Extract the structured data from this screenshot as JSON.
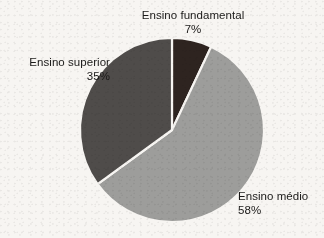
{
  "chart_data": {
    "type": "pie",
    "title": "",
    "subtitle": "",
    "xlabel": "",
    "ylabel": "",
    "legend_position": "none",
    "grid": false,
    "labels_on_slices": false,
    "label_style": "callout text outside slices",
    "start_angle_deg": 0,
    "direction": "clockwise",
    "units": "percent",
    "categories": [
      "Ensino fundamental",
      "Ensino médio",
      "Ensino superior"
    ],
    "values": [
      7,
      58,
      35
    ],
    "total": 100,
    "slices": [
      {
        "name": "Ensino fundamental",
        "value": 7,
        "value_label": "7%",
        "color": "#2e2420",
        "start_angle_deg": 0,
        "sweep_angle_deg": 25.2,
        "label_position": "top"
      },
      {
        "name": "Ensino médio",
        "value": 58,
        "value_label": "58%",
        "color": "#9d9d9b",
        "start_angle_deg": 25.2,
        "sweep_angle_deg": 208.8,
        "label_position": "bottom-right"
      },
      {
        "name": "Ensino superior",
        "value": 35,
        "value_label": "35%",
        "color": "#4f4c4a",
        "start_angle_deg": 234.0,
        "sweep_angle_deg": 126.0,
        "label_position": "left"
      }
    ]
  },
  "figure": {
    "background_color": "#f7f5f2",
    "slice_separator_color": "#f7f5f2",
    "text_color": "#1b1a19",
    "center_x": 172,
    "center_y": 130,
    "radius": 92
  },
  "labels": {
    "fundamental": {
      "name": "Ensino fundamental",
      "percent": "7%"
    },
    "medio": {
      "name": "Ensino médio",
      "percent": "58%"
    },
    "superior": {
      "name": "Ensino superior",
      "percent": "35%"
    }
  }
}
